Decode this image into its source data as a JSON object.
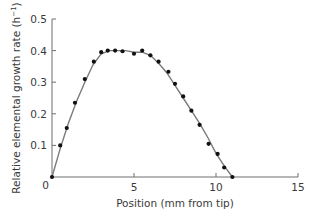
{
  "chart_data": {
    "type": "line",
    "title": "",
    "xlabel": "Position (mm from tip)",
    "ylabel": "Relative elemental growth rate (h⁻¹)",
    "ylabel_main": "Relative elemental growth rate (h",
    "ylabel_sup": "−1",
    "ylabel_close": ")",
    "xlim": [
      0,
      15
    ],
    "ylim": [
      0,
      0.5
    ],
    "xticks": [
      0,
      5,
      10,
      15
    ],
    "xtick_labels": [
      "0",
      "5",
      "10",
      "15"
    ],
    "yticks": [
      0,
      0.1,
      0.2,
      0.3,
      0.4,
      0.5
    ],
    "ytick_labels": [
      "0",
      "0.1",
      "0.2",
      "0.3",
      "0.4",
      "0.5"
    ],
    "grid": false,
    "legend": null,
    "series": [
      {
        "name": "measured",
        "style": "markers",
        "color": "#111111",
        "x": [
          0.0,
          0.5,
          0.9,
          1.4,
          2.0,
          2.55,
          3.0,
          3.4,
          3.85,
          4.3,
          5.0,
          5.5,
          6.0,
          6.5,
          7.1,
          7.5,
          8.0,
          8.5,
          9.0,
          9.55,
          10.1,
          10.5,
          11.0
        ],
        "y": [
          0.0,
          0.1,
          0.155,
          0.235,
          0.31,
          0.365,
          0.395,
          0.4,
          0.4,
          0.398,
          0.39,
          0.4,
          0.385,
          0.365,
          0.333,
          0.295,
          0.255,
          0.21,
          0.165,
          0.105,
          0.073,
          0.03,
          0.0
        ]
      },
      {
        "name": "fitted curve",
        "style": "line",
        "color": "#7a7a7a",
        "x": [
          0.0,
          0.5,
          1.0,
          1.5,
          2.0,
          2.5,
          3.0,
          3.5,
          4.0,
          4.5,
          5.0,
          5.5,
          6.0,
          6.5,
          7.0,
          7.5,
          8.0,
          8.5,
          9.0,
          9.5,
          10.0,
          10.5,
          11.0
        ],
        "y": [
          0.0,
          0.09,
          0.17,
          0.24,
          0.3,
          0.355,
          0.39,
          0.4,
          0.4,
          0.4,
          0.395,
          0.395,
          0.385,
          0.36,
          0.33,
          0.29,
          0.25,
          0.21,
          0.17,
          0.125,
          0.075,
          0.035,
          0.0
        ]
      }
    ]
  }
}
